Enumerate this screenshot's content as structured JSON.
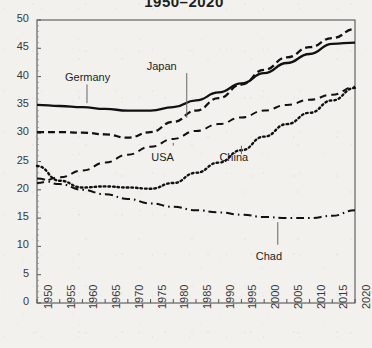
{
  "chart_data": {
    "type": "line",
    "title": "1950–2020",
    "xlabel": "",
    "ylabel": "",
    "xlim": [
      1950,
      2020
    ],
    "ylim": [
      0,
      50
    ],
    "grid": false,
    "legend_position": "inline-annotations",
    "x": [
      1950,
      1955,
      1960,
      1965,
      1970,
      1975,
      1980,
      1985,
      1990,
      1995,
      2000,
      2005,
      2010,
      2015,
      2020
    ],
    "xtick_labels": [
      "1950",
      "1955",
      "1960",
      "1965",
      "1970",
      "1975",
      "1980",
      "1985",
      "1990",
      "1995",
      "2000",
      "2005",
      "2010",
      "2015",
      "2020"
    ],
    "ytick_labels": [
      "0",
      "5",
      "10",
      "15",
      "20",
      "25",
      "30",
      "35",
      "40",
      "45",
      "50"
    ],
    "yticks": [
      0,
      5,
      10,
      15,
      20,
      25,
      30,
      35,
      40,
      45,
      50
    ],
    "series": [
      {
        "name": "Germany",
        "style": "solid",
        "label_x": 1961,
        "label_y": 39.5,
        "values": [
          35.0,
          34.8,
          34.6,
          34.3,
          34.0,
          34.0,
          34.6,
          35.8,
          37.2,
          38.8,
          40.6,
          42.4,
          44.0,
          45.8,
          46.0
        ]
      },
      {
        "name": "Japan",
        "style": "dashed",
        "label_x": 1979,
        "label_y": 41.5,
        "values": [
          30.2,
          30.2,
          30.1,
          29.8,
          29.2,
          30.2,
          32.0,
          34.0,
          36.2,
          38.6,
          41.2,
          43.4,
          45.2,
          46.8,
          48.4
        ]
      },
      {
        "name": "USA",
        "style": "dashed-thin",
        "label_x": 1980,
        "label_y": 25.5,
        "values": [
          21.2,
          22.2,
          23.4,
          24.8,
          26.2,
          27.6,
          29.0,
          30.4,
          31.6,
          32.8,
          34.0,
          35.0,
          35.9,
          36.8,
          38.2
        ]
      },
      {
        "name": "China",
        "style": "dotted",
        "label_x": 1995,
        "label_y": 25.5,
        "values": [
          24.2,
          21.6,
          20.4,
          20.6,
          20.4,
          20.2,
          21.2,
          23.0,
          24.8,
          27.0,
          29.4,
          31.6,
          33.6,
          35.8,
          38.0
        ]
      },
      {
        "name": "Chad",
        "style": "dash-dot",
        "label_x": 2003,
        "label_y": 8.0,
        "values": [
          22.0,
          21.0,
          20.0,
          19.2,
          18.4,
          17.6,
          17.0,
          16.4,
          16.0,
          15.6,
          15.2,
          15.0,
          15.0,
          15.4,
          16.4
        ]
      }
    ]
  }
}
